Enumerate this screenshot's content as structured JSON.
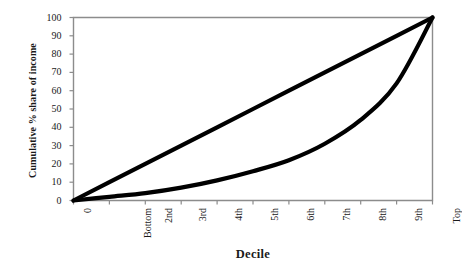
{
  "chart_data": {
    "type": "line",
    "title": "",
    "xlabel": "Decile",
    "ylabel": "Cumulative % share of income",
    "x": [
      0,
      1,
      2,
      3,
      4,
      5,
      6,
      7,
      8,
      9,
      10
    ],
    "categories": [
      "0",
      "Bottom",
      "2nd",
      "3rd",
      "4th",
      "5th",
      "6th",
      "7th",
      "8th",
      "9th",
      "Top"
    ],
    "xtick_labels": [
      "0",
      "Bottom",
      "2nd",
      "3rd",
      "4th",
      "5th",
      "6th",
      "7th",
      "8th",
      "9th",
      "Top"
    ],
    "ytick_labels": [
      "0",
      "10",
      "20",
      "30",
      "40",
      "50",
      "60",
      "70",
      "80",
      "90",
      "100"
    ],
    "ylim": [
      0,
      100
    ],
    "xlim": [
      0,
      10
    ],
    "grid": false,
    "legend": "none",
    "series": [
      {
        "name": "Line of equality",
        "values": [
          0,
          10,
          20,
          30,
          40,
          50,
          60,
          70,
          80,
          90,
          100
        ],
        "color": "#000000"
      },
      {
        "name": "Lorenz curve",
        "values": [
          0,
          2,
          4,
          7,
          11,
          16,
          22,
          31,
          44,
          64,
          100
        ],
        "color": "#000000"
      }
    ]
  },
  "axes": {
    "y_title": "Cumulative % share of income",
    "x_title": "Decile"
  },
  "style": {
    "line_color": "#000000",
    "frame_color": "#808080",
    "background": "#ffffff"
  }
}
